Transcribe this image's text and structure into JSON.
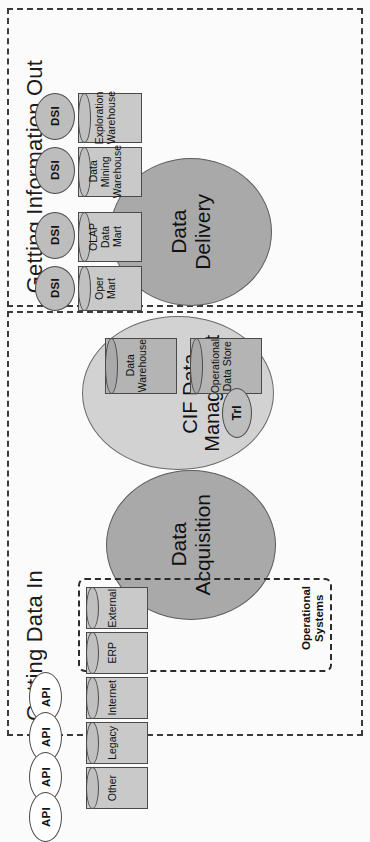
{
  "diagram": {
    "orientation": "rotated-90",
    "colors": {
      "process_dark": "#a9a9a9",
      "process_light": "#d2d2d2",
      "cylinder": "#c9c9c9",
      "cylinder_dark": "#b4b4b4",
      "oval_gray": "#bdbdbd",
      "oval_white": "#ffffff",
      "border": "#3a3a3a",
      "text": "#1b1b1b"
    }
  },
  "panels": [
    {
      "id": "getting-information-out",
      "title": "Getting Information Out"
    },
    {
      "id": "getting-data-in",
      "title": "Getting Data In"
    }
  ],
  "processes": [
    {
      "id": "data-delivery",
      "label": "Data\nDelivery"
    },
    {
      "id": "cif-data-management",
      "label": "CIF Data\nManagement"
    },
    {
      "id": "data-acquisition",
      "label": "Data\nAcquisition"
    }
  ],
  "output_stores": [
    {
      "label": "Exploration\nWarehouse",
      "consumer": "DSI"
    },
    {
      "label": "Data Mining\nWarehouse",
      "consumer": "DSI"
    },
    {
      "label": "OLAP Data\nMart",
      "consumer": "DSI"
    },
    {
      "label": "Oper Mart",
      "consumer": "DSI"
    }
  ],
  "cif_stores": [
    {
      "label": "Data\nWarehouse"
    },
    {
      "label": "Operational\nData Store",
      "adjunct": "Trl"
    }
  ],
  "operational_systems": {
    "group_label": "Operational\nSystems",
    "sources": [
      {
        "label": "External",
        "api": "API"
      },
      {
        "label": "ERP",
        "api": "API"
      },
      {
        "label": "Internet",
        "api": "API"
      },
      {
        "label": "Legacy",
        "api": "API"
      },
      {
        "label": "Other",
        "api": "API"
      }
    ]
  },
  "labels": {
    "dsi": "DSI",
    "api": "API",
    "trl": "Trl"
  }
}
